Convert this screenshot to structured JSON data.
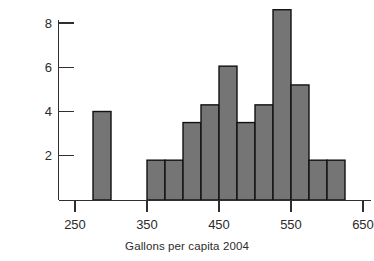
{
  "chart_data": {
    "type": "bar",
    "title": "",
    "subtitle": "",
    "xlabel": "Gallons per capita 2004",
    "ylabel": "# of States",
    "bin_width": 25,
    "xlim": [
      240,
      660
    ],
    "ylim": [
      0,
      8.8
    ],
    "grid": false,
    "legend": null,
    "xticks": [
      250,
      350,
      450,
      550,
      650
    ],
    "xtick_labels": [
      "250",
      "350",
      "450",
      "550",
      "650"
    ],
    "yticks": [
      2,
      4,
      6,
      8
    ],
    "ytick_labels": [
      "2",
      "4",
      "6",
      "8"
    ],
    "bin_starts": [
      275,
      350,
      375,
      400,
      425,
      450,
      475,
      500,
      525,
      550,
      575,
      600
    ],
    "bin_ends": [
      300,
      375,
      400,
      425,
      450,
      475,
      500,
      525,
      550,
      575,
      600,
      625
    ],
    "bin_labels": [
      "275-300",
      "350-375",
      "375-400",
      "400-425",
      "425-450",
      "450-475",
      "475-500",
      "500-525",
      "525-550",
      "550-575",
      "575-600",
      "600-625"
    ],
    "values": [
      4.0,
      1.8,
      1.8,
      3.5,
      4.3,
      6.05,
      3.5,
      4.3,
      8.6,
      5.2,
      1.8,
      1.8
    ],
    "categories": [
      "275-300",
      "350-375",
      "375-400",
      "400-425",
      "425-450",
      "450-475",
      "475-500",
      "500-525",
      "525-550",
      "550-575",
      "575-600",
      "600-625"
    ],
    "bar_fill_color": "#757575",
    "bar_edge_color": "#111111",
    "axis_color": "#2f2f2f",
    "background_color": "#ffffff"
  },
  "axes": {
    "x_title": "Gallons per capita 2004",
    "y_title": "# of States"
  }
}
